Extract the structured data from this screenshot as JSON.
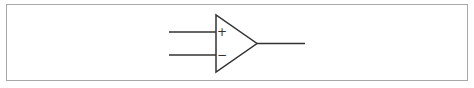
{
  "diagram": {
    "type": "op-amp symbol",
    "inputs": [
      {
        "name": "non-inverting",
        "sign": "+"
      },
      {
        "name": "inverting",
        "sign": "−"
      }
    ],
    "output": {
      "name": "output"
    }
  },
  "colors": {
    "stroke": "#333333",
    "border": "#a8a8a8",
    "background": "#ffffff"
  }
}
